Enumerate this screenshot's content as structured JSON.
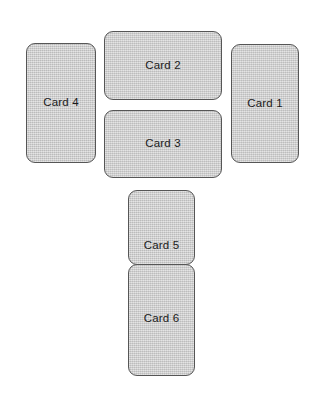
{
  "scene": {
    "title": "Card Layout",
    "background_color": "#ffffff",
    "card_fill_color": "#cbcbcb",
    "card_border_color": "#565656",
    "card_text_color": "#1b1b1b"
  },
  "cards": [
    {
      "id": "card-1",
      "label": "Card 1",
      "orientation": "portrait",
      "x": 231,
      "y": 44,
      "width": 68,
      "height": 119,
      "label_align": "center"
    },
    {
      "id": "card-2",
      "label": "Card 2",
      "orientation": "landscape",
      "x": 104,
      "y": 31,
      "width": 118,
      "height": 69,
      "label_align": "center"
    },
    {
      "id": "card-3",
      "label": "Card 3",
      "orientation": "landscape",
      "x": 104,
      "y": 110,
      "width": 118,
      "height": 68,
      "label_align": "center"
    },
    {
      "id": "card-4",
      "label": "Card 4",
      "orientation": "portrait",
      "x": 26,
      "y": 43,
      "width": 70,
      "height": 120,
      "label_align": "center"
    },
    {
      "id": "card-5",
      "label": "Card 5",
      "orientation": "portrait",
      "x": 128,
      "y": 190,
      "width": 67,
      "height": 75,
      "label_align": "bottom"
    },
    {
      "id": "card-6",
      "label": "Card 6",
      "orientation": "portrait",
      "x": 128,
      "y": 264,
      "width": 67,
      "height": 112,
      "label_align": "upper"
    }
  ]
}
